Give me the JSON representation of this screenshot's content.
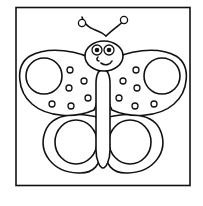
{
  "image": {
    "subject": "butterfly coloring page",
    "style": "black line art on white",
    "colors": {
      "background": "#ffffff",
      "line": "#111111",
      "frame": "#111111"
    }
  },
  "frame": {
    "shape": "square border"
  },
  "butterfly": {
    "antennae": 2,
    "eyes": 2,
    "expression": "smile",
    "upper_wings": [
      {
        "side": "left",
        "large_circle": 1,
        "small_dots": 7
      },
      {
        "side": "right",
        "large_circle": 1,
        "small_dots": 7
      }
    ],
    "lower_wings": [
      {
        "side": "left",
        "inner_circle": 1
      },
      {
        "side": "right",
        "inner_circle": 1
      }
    ]
  }
}
